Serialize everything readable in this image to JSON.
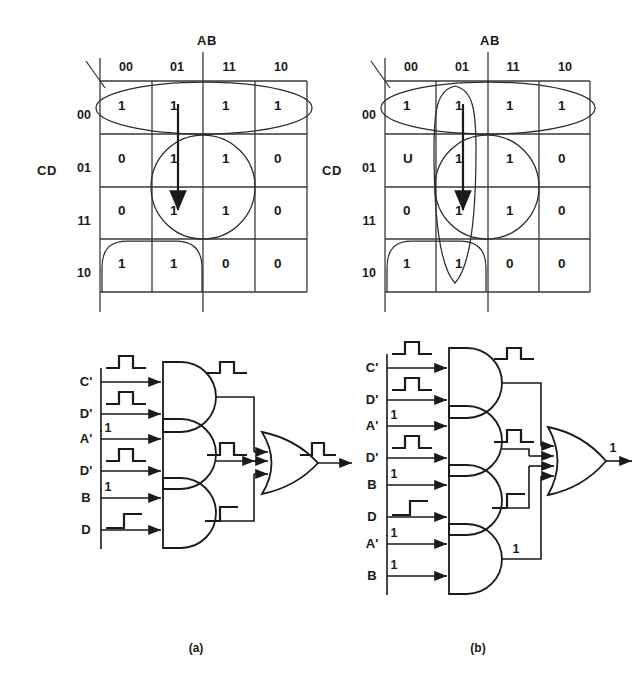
{
  "figure": {
    "captions": {
      "left": "(a)",
      "right": "(b)"
    }
  },
  "kmap_a": {
    "col_header": "AB",
    "row_header": "CD",
    "col_labels": [
      "00",
      "01",
      "11",
      "10"
    ],
    "row_labels": [
      "00",
      "01",
      "11",
      "10"
    ],
    "cells": [
      [
        "1",
        "1",
        "1",
        "1"
      ],
      [
        "0",
        "1",
        "1",
        "0"
      ],
      [
        "0",
        "1",
        "1",
        "0"
      ],
      [
        "1",
        "1",
        "0",
        "0"
      ]
    ],
    "groups": [
      "top-row-ellipse",
      "center-circle",
      "bottom-left-group"
    ],
    "annotation": "hazard-transition-arrow"
  },
  "kmap_b": {
    "col_header": "AB",
    "row_header": "CD",
    "col_labels": [
      "00",
      "01",
      "11",
      "10"
    ],
    "row_labels": [
      "00",
      "01",
      "11",
      "10"
    ],
    "cells": [
      [
        "1",
        "1",
        "1",
        "1"
      ],
      [
        "U",
        "1",
        "1",
        "0"
      ],
      [
        "0",
        "1",
        "1",
        "0"
      ],
      [
        "1",
        "1",
        "0",
        "0"
      ]
    ],
    "groups": [
      "top-row-ellipse",
      "center-circle",
      "bottom-left-group",
      "column-01-consensus-loop"
    ],
    "annotation": "hazard-transition-arrow"
  },
  "circuit_a": {
    "gates": [
      {
        "id": "and1",
        "type": "AND",
        "inputs": [
          "C'",
          "D'"
        ],
        "input_values": [
          "",
          ""
        ],
        "output_value": ""
      },
      {
        "id": "and2",
        "type": "AND",
        "inputs": [
          "A'",
          "D'"
        ],
        "input_values": [
          "1",
          ""
        ],
        "output_value": ""
      },
      {
        "id": "and3",
        "type": "AND",
        "inputs": [
          "B",
          "D"
        ],
        "input_values": [
          "1",
          ""
        ],
        "output_value": ""
      },
      {
        "id": "or1",
        "type": "OR",
        "inputs": [
          "and1",
          "and2",
          "and3"
        ],
        "output_value": ""
      }
    ],
    "output_label": "",
    "output_waveform": "glitch-pulse"
  },
  "circuit_b": {
    "gates": [
      {
        "id": "and1",
        "type": "AND",
        "inputs": [
          "C'",
          "D'"
        ],
        "input_values": [
          "",
          ""
        ],
        "output_value": ""
      },
      {
        "id": "and2",
        "type": "AND",
        "inputs": [
          "A'",
          "D'"
        ],
        "input_values": [
          "1",
          ""
        ],
        "output_value": ""
      },
      {
        "id": "and3",
        "type": "AND",
        "inputs": [
          "B",
          "D"
        ],
        "input_values": [
          "1",
          ""
        ],
        "output_value": ""
      },
      {
        "id": "and4",
        "type": "AND",
        "inputs": [
          "A'",
          "B"
        ],
        "input_values": [
          "1",
          "1"
        ],
        "output_value": "1"
      },
      {
        "id": "or1",
        "type": "OR",
        "inputs": [
          "and1",
          "and2",
          "and3",
          "and4"
        ],
        "output_value": "1"
      }
    ],
    "output_label": "1",
    "output_waveform": "steady-high"
  }
}
